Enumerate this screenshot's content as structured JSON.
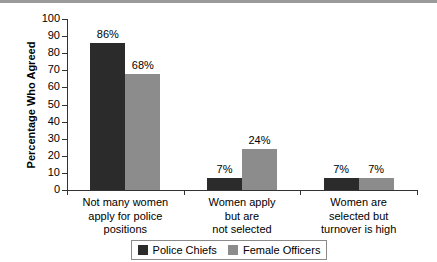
{
  "chart_data": {
    "type": "bar",
    "title": "",
    "xlabel": "",
    "ylabel": "Percentage Who Agreed",
    "ylim": [
      0,
      100
    ],
    "ytick_labels": [
      "100",
      "90",
      "80",
      "70",
      "60",
      "50",
      "40",
      "30",
      "20",
      "10",
      "0"
    ],
    "ytick_values": [
      100,
      90,
      80,
      70,
      60,
      50,
      40,
      30,
      20,
      10,
      0
    ],
    "grid": false,
    "legend_position": "bottom-center",
    "categories": [
      "Not many women apply for police positions",
      "Women apply but are not selected",
      "Women are selected but turnover is high"
    ],
    "category_lines": [
      [
        "Not many women",
        "apply for police",
        "positions"
      ],
      [
        "Women apply",
        "but are",
        "not selected"
      ],
      [
        "Women are",
        "selected but",
        "turnover is high"
      ]
    ],
    "series": [
      {
        "name": "Police Chiefs",
        "color": "#2b2b2b",
        "values": [
          86,
          7,
          7
        ],
        "labels": [
          "86%",
          "7%",
          "7%"
        ]
      },
      {
        "name": "Female Officers",
        "color": "#8c8c8c",
        "values": [
          68,
          24,
          7
        ],
        "labels": [
          "68%",
          "24%",
          "7%"
        ]
      }
    ]
  },
  "legend": {
    "entries": [
      {
        "label": "Police Chiefs",
        "swatch": "dark-gray-swatch-icon"
      },
      {
        "label": "Female Officers",
        "swatch": "light-gray-swatch-icon"
      }
    ]
  }
}
